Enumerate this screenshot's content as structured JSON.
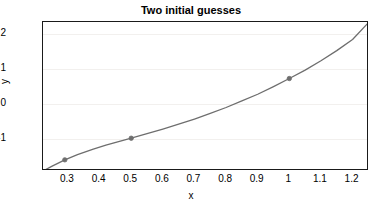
{
  "chart_data": {
    "type": "line",
    "title": "Two initial guesses",
    "xlabel": "x",
    "ylabel": "y",
    "xlim": [
      0.221,
      1.252
    ],
    "ylim": [
      -1.93,
      2.34
    ],
    "grid": true,
    "legend": "none",
    "xticks": [
      "0.3",
      "0.4",
      "0.5",
      "0.6",
      "0.7",
      "0.8",
      "0.9",
      "1",
      "1.1",
      "1.2"
    ],
    "xtick_values": [
      0.3,
      0.4,
      0.5,
      0.6,
      0.7,
      0.8,
      0.9,
      1.0,
      1.1,
      1.2
    ],
    "yticks": [
      "2",
      "1",
      "0",
      "-1"
    ],
    "ytick_values": [
      2,
      1,
      0,
      -1
    ],
    "series": [
      {
        "name": "f(x)",
        "color": "#6e6e6e",
        "linewidth": 1.3,
        "x": [
          0.221,
          0.25,
          0.29,
          0.33,
          0.38,
          0.42,
          0.46,
          0.5,
          0.55,
          0.6,
          0.65,
          0.7,
          0.75,
          0.8,
          0.85,
          0.9,
          0.95,
          1.0,
          1.05,
          1.1,
          1.15,
          1.2,
          1.252
        ],
        "y": [
          -1.93,
          -1.79,
          -1.61,
          -1.46,
          -1.3,
          -1.19,
          -1.09,
          -0.99,
          -0.86,
          -0.73,
          -0.59,
          -0.44,
          -0.28,
          -0.11,
          0.08,
          0.27,
          0.49,
          0.72,
          0.96,
          1.23,
          1.52,
          1.84,
          2.34
        ]
      }
    ],
    "markers": [
      {
        "label": "initial guess 1",
        "x": 0.29,
        "y": -1.61,
        "color": "#6e6e6e"
      },
      {
        "label": "initial guess 2",
        "x": 0.5,
        "y": -0.99,
        "color": "#6e6e6e"
      },
      {
        "label": "initial guess 3",
        "x": 1.0,
        "y": 0.72,
        "color": "#6e6e6e"
      }
    ],
    "axis_color": "#1a1a1a",
    "grid_color": "#f2f0ee",
    "background": "#ffffff"
  }
}
